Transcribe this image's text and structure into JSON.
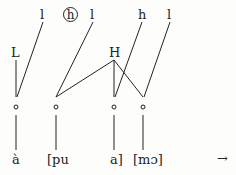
{
  "diagram": {
    "floating_tones": [
      {
        "label": "l",
        "x": 43
      },
      {
        "label": "h",
        "x": 70,
        "circled": true
      },
      {
        "label": "l",
        "x": 93
      },
      {
        "label": "h",
        "x": 142
      },
      {
        "label": "l",
        "x": 170
      }
    ],
    "tone_nodes": [
      {
        "label": "L",
        "x": 16
      },
      {
        "label": "H",
        "x": 114
      }
    ],
    "tbu_symbol": "∘",
    "segments": [
      {
        "label": "à",
        "x": 16
      },
      {
        "label": "[pu",
        "x": 56
      },
      {
        "label": "a]",
        "x": 118
      },
      {
        "label": "[mɔ]",
        "x": 148
      }
    ],
    "arrow": "→"
  }
}
